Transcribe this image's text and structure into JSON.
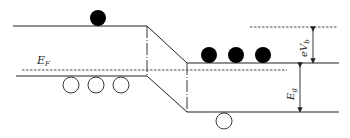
{
  "diagram": {
    "type": "energy-band-diagram",
    "labels": {
      "fermi_level": {
        "main": "E",
        "sub": "F"
      },
      "barrier": {
        "main": "eV",
        "sub": "b"
      },
      "band_gap": {
        "main": "E",
        "sub": "g"
      }
    },
    "colors": {
      "line": "#222222",
      "electron_fill": "#000000",
      "hole_fill": "#ffffff"
    },
    "left_region": {
      "electrons": 1,
      "holes": 3
    },
    "right_region": {
      "electrons": 3,
      "holes": 1
    }
  }
}
